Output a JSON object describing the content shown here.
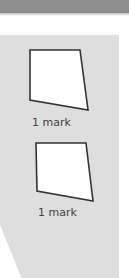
{
  "page": {
    "colors": {
      "header_band": "#8e8e8e",
      "answer_panel": "#dedede",
      "shape_stroke": "#333333",
      "shape_fill": "#ffffff",
      "label_text": "#444444"
    }
  },
  "answer_box": {
    "items": [
      {
        "shape": "quadrilateral",
        "label": "1 mark"
      },
      {
        "shape": "quadrilateral",
        "label": "1 mark"
      }
    ]
  }
}
